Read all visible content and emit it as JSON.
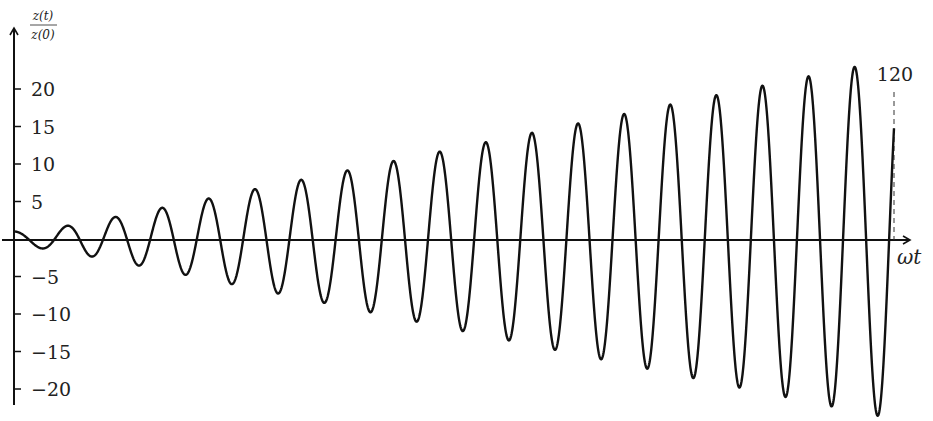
{
  "chart_data": {
    "type": "line",
    "title": "",
    "xlabel": "ωt",
    "ylabel_numerator": "z(t)",
    "ylabel_denominator": "z(0)",
    "function": "cos(ωt) + 0.2·ωt·sin(ωt)",
    "xlim": [
      0,
      120
    ],
    "ylim": [
      -24,
      24
    ],
    "yticks": [
      -20,
      -15,
      -10,
      -5,
      5,
      10,
      15,
      20
    ],
    "ytick_labels": [
      "−20",
      "−15",
      "−10",
      "−5",
      "5",
      "10",
      "15",
      "20"
    ],
    "annotations": [
      {
        "text": "120",
        "x": 120,
        "style": "dashed vertical line"
      }
    ],
    "grid": false,
    "legend": null,
    "series": [
      {
        "name": "z(t)/z(0)",
        "sample_points": [
          {
            "x": 0,
            "y": 1.0
          },
          {
            "x": 3.9,
            "y": -1.3
          },
          {
            "x": 7.5,
            "y": 1.8
          },
          {
            "x": 57,
            "y": 10.2
          },
          {
            "x": 101,
            "y": 20.0
          },
          {
            "x": 114.3,
            "y": 22.7
          },
          {
            "x": 117.3,
            "y": -23.9
          },
          {
            "x": 120,
            "y": 14.8
          }
        ],
        "peak_values_approx": [
          1.8,
          3.0,
          4.3,
          5.5,
          6.8,
          8.0,
          9.3,
          10.5,
          11.8,
          13.0,
          14.3,
          15.5,
          16.8,
          18.0,
          19.3,
          20.5,
          21.8,
          22.7
        ],
        "trough_values_approx": [
          -1.3,
          -2.5,
          -3.8,
          -5.0,
          -6.3,
          -7.5,
          -8.8,
          -10.0,
          -11.3,
          -12.5,
          -13.8,
          -15.0,
          -16.3,
          -17.5,
          -18.8,
          -20.0,
          -21.3,
          -22.5,
          -23.9
        ]
      }
    ]
  },
  "labels": {
    "y_num": "z(t)",
    "y_den": "z(0)",
    "x": "ωt",
    "end_marker": "120"
  }
}
